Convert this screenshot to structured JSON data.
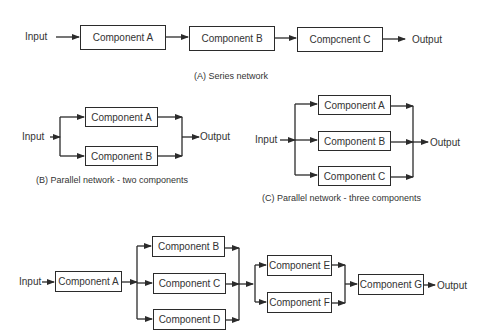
{
  "series": {
    "input_label": "Input",
    "output_label": "Output",
    "components": [
      "Component A",
      "Component B",
      "Compcnent C"
    ],
    "caption": "(A) Series network"
  },
  "parallel_two": {
    "input_label": "Input",
    "output_label": "Output",
    "components": [
      "Component A",
      "Component B"
    ],
    "caption": "(B) Parallel network - two components"
  },
  "parallel_three": {
    "input_label": "Input",
    "output_label": "Output",
    "components": [
      "Component A",
      "Component B",
      "Component C"
    ],
    "caption": "(C) Parallel network - three components"
  },
  "mixed": {
    "input_label": "Input",
    "output_label": "Output",
    "components": [
      "Component A",
      "Component B",
      "Component C",
      "Component D",
      "Component E",
      "Component F",
      "Component G"
    ]
  }
}
